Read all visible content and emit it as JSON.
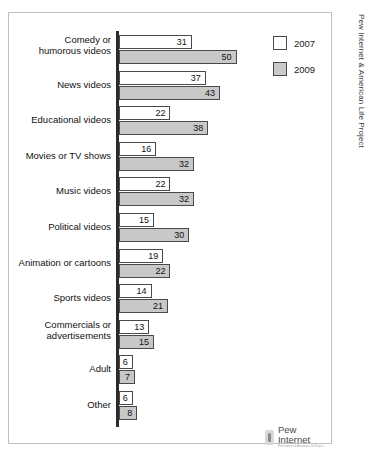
{
  "credit": {
    "vertical_text": "Pew Internet & American Life Project",
    "logo_wordmark": "Pew Internet",
    "logo_tagline": "Pew Internet & American Life Project"
  },
  "legend": {
    "entries": [
      {
        "label": "2007",
        "color": "#ffffff",
        "key": "y2007"
      },
      {
        "label": "2009",
        "color": "#c8c8c8",
        "key": "y2009"
      }
    ]
  },
  "chart_data": {
    "type": "bar",
    "orientation": "horizontal",
    "title": "",
    "xlabel": "",
    "ylabel": "",
    "xlim": [
      0,
      50
    ],
    "grid": false,
    "legend_position": "top-right",
    "categories": [
      "Comedy or humorous videos",
      "News videos",
      "Educational videos",
      "Movies or TV shows",
      "Music videos",
      "Political videos",
      "Animation or cartoons",
      "Sports videos",
      "Commercials or advertisements",
      "Adult",
      "Other"
    ],
    "category_lines": [
      [
        "Comedy or",
        "humorous videos"
      ],
      [
        "News videos"
      ],
      [
        "Educational videos"
      ],
      [
        "Movies or TV shows"
      ],
      [
        "Music videos"
      ],
      [
        "Political videos"
      ],
      [
        "Animation or cartoons"
      ],
      [
        "Sports videos"
      ],
      [
        "Commercials or",
        "advertisements"
      ],
      [
        "Adult"
      ],
      [
        "Other"
      ]
    ],
    "series": [
      {
        "name": "2007",
        "color": "#ffffff",
        "values": [
          31,
          37,
          22,
          16,
          22,
          15,
          19,
          14,
          13,
          6,
          6
        ]
      },
      {
        "name": "2009",
        "color": "#c8c8c8",
        "values": [
          50,
          43,
          38,
          32,
          32,
          30,
          22,
          21,
          15,
          7,
          8
        ]
      }
    ]
  }
}
